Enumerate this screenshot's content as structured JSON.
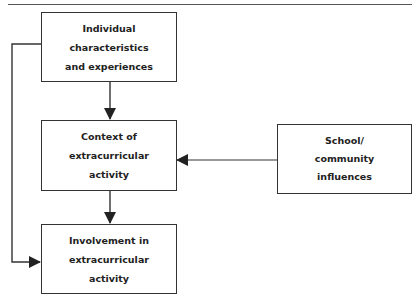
{
  "diagram": {
    "nodes": {
      "individual": {
        "lines": [
          "Individual",
          "characteristics",
          "and experiences"
        ]
      },
      "context": {
        "lines": [
          "Context of",
          "extracurricular",
          "activity"
        ]
      },
      "school": {
        "lines": [
          "School/",
          "community",
          "influences"
        ]
      },
      "involvement": {
        "lines": [
          "Involvement in",
          "extracurricular",
          "activity"
        ]
      }
    },
    "edges": [
      {
        "from": "individual",
        "to": "context"
      },
      {
        "from": "context",
        "to": "involvement"
      },
      {
        "from": "school",
        "to": "context"
      },
      {
        "from": "individual",
        "to": "involvement"
      }
    ],
    "colors": {
      "stroke": "#333333",
      "text": "#222222",
      "background": "#ffffff"
    }
  }
}
